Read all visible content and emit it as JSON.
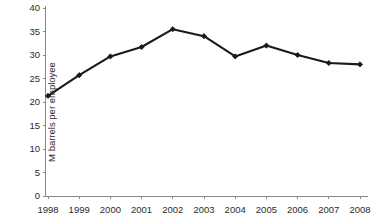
{
  "chart_data": {
    "type": "line",
    "title": "",
    "xlabel": "",
    "ylabel": "M barrels per employee",
    "categories": [
      "1998",
      "1999",
      "2000",
      "2001",
      "2002",
      "2003",
      "2004",
      "2005",
      "2006",
      "2007",
      "2008"
    ],
    "values": [
      21.3,
      25.7,
      29.7,
      31.7,
      35.5,
      34.0,
      29.7,
      32.0,
      30.0,
      28.3,
      28.0
    ],
    "series": [
      {
        "name": "M barrels per employee",
        "values": [
          21.3,
          25.7,
          29.7,
          31.7,
          35.5,
          34.0,
          29.7,
          32.0,
          30.0,
          28.3,
          28.0
        ]
      }
    ],
    "ylim": [
      0,
      40
    ],
    "yticks": [
      0,
      5,
      10,
      15,
      20,
      25,
      30,
      35,
      40
    ],
    "ytick_labels": [
      "0",
      "5",
      "10",
      "15",
      "20",
      "25",
      "30",
      "35",
      "40"
    ],
    "xtick_labels": [
      "1998",
      "1999",
      "2000",
      "2001",
      "2002",
      "2003",
      "2004",
      "2005",
      "2006",
      "2007",
      "2008"
    ],
    "grid": false,
    "legend": false,
    "legend_position": "none",
    "marker": "diamond",
    "line_color": "#1a1a1a",
    "axis_color": "#8a8a8a",
    "background_color": "#ffffff"
  }
}
